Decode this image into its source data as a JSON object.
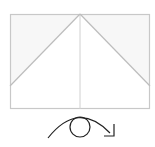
{
  "diagram": {
    "type": "folding-instruction",
    "colors": {
      "paper_edge": "#c8c8c8",
      "fold_line": "#c0c0c0",
      "shaded_region": "#f6f6f6",
      "arrow": "#222222"
    },
    "paper": {
      "x": 10,
      "y": 14,
      "width": 140,
      "height": 95
    },
    "apex": {
      "x": 80,
      "y": 14
    },
    "diagonal_endpoints_y": 86,
    "symbol": "turn-over-icon"
  }
}
